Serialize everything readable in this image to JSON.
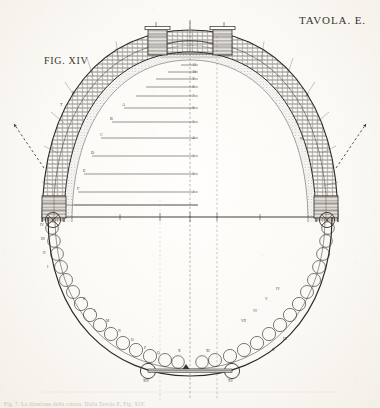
{
  "plate": {
    "title": "TAVOLA. E.",
    "figure_label": "FIG. XIV",
    "caption": "Fig. 7. La direzione della catena. Dalla Tavola E, Fig. XIV.",
    "background_color": "#fdfcfa",
    "ink_color": "#3a332c"
  },
  "diagram": {
    "type": "architectural-section",
    "axes": {
      "springing_line_y": 217,
      "center_axis_x": 190,
      "secondary_axis_x": 217,
      "vertical_axis_label": "centre-line"
    },
    "dome": {
      "crown_y": 30,
      "outer_half_span": 148,
      "inner_half_span": 128,
      "masonry_band_layers": 3,
      "oculus_label": "lantern opening"
    },
    "chord_lines": {
      "count": 11,
      "note": "horizontal chords from intrados to centre axis",
      "tick_numerals": [
        "11",
        "10",
        "9",
        "8",
        "7",
        "6",
        "5",
        "4",
        "3",
        "2",
        "1"
      ]
    },
    "catenary": {
      "link_count_per_side": 16,
      "note": "hanging chain of circular links forming the inverted catenary oval"
    },
    "tie_bar": {
      "present": true,
      "y": 371,
      "x_left": 145,
      "x_right": 235
    },
    "arrows": [
      {
        "name": "left-thrust-arrow",
        "direction": "up-left",
        "style": "dashed",
        "tip_x": 12,
        "tip_y": 122
      },
      {
        "name": "right-thrust-arrow",
        "direction": "up-right",
        "style": "dashed",
        "tip_x": 358,
        "tip_y": 122
      }
    ],
    "point_labels_left": [
      "IV",
      "III",
      "II",
      "I",
      "K",
      "L",
      "M",
      "N",
      "O",
      "P",
      "Q",
      "R",
      "S",
      "T"
    ],
    "point_labels_right": [
      "IV",
      "V",
      "VI",
      "VII",
      "VIII",
      "IX",
      "X",
      "XI"
    ],
    "base_labels": [
      "XIV",
      "XV"
    ],
    "intrados_labels": [
      "A",
      "B",
      "C",
      "D",
      "E",
      "F",
      "G",
      "H"
    ]
  }
}
